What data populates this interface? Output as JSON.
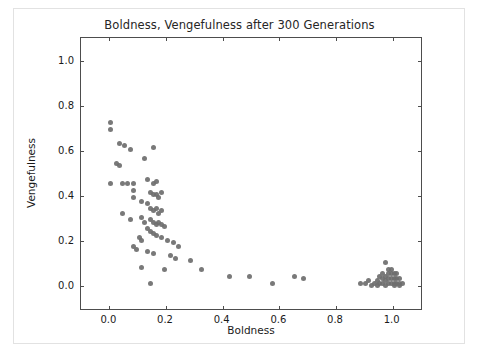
{
  "chart_data": {
    "type": "scatter",
    "title": "Boldness, Vengefulness after 300 Generations",
    "xlabel": "Boldness",
    "ylabel": "Vengefulness",
    "xlim": [
      -0.1,
      1.1
    ],
    "ylim": [
      -0.1,
      1.1
    ],
    "xticks": [
      0.0,
      0.2,
      0.4,
      0.6,
      0.8,
      1.0
    ],
    "xticklabels": [
      "0.0",
      "0.2",
      "0.4",
      "0.6",
      "0.8",
      "1.0"
    ],
    "yticks": [
      0.0,
      0.2,
      0.4,
      0.6,
      0.8,
      1.0
    ],
    "yticklabels": [
      "0.0",
      "0.2",
      "0.4",
      "0.6",
      "0.8",
      "1.0"
    ],
    "grid": false,
    "legend": null,
    "marker_color": "#6e6e6e",
    "marker_size": 5,
    "series": [
      {
        "name": "agents",
        "points": [
          [
            0.005,
            0.725
          ],
          [
            0.005,
            0.695
          ],
          [
            0.035,
            0.635
          ],
          [
            0.055,
            0.625
          ],
          [
            0.075,
            0.605
          ],
          [
            0.025,
            0.545
          ],
          [
            0.035,
            0.535
          ],
          [
            0.125,
            0.565
          ],
          [
            0.155,
            0.615
          ],
          [
            0.005,
            0.455
          ],
          [
            0.045,
            0.455
          ],
          [
            0.065,
            0.455
          ],
          [
            0.085,
            0.455
          ],
          [
            0.085,
            0.425
          ],
          [
            0.085,
            0.395
          ],
          [
            0.135,
            0.475
          ],
          [
            0.155,
            0.455
          ],
          [
            0.165,
            0.465
          ],
          [
            0.145,
            0.415
          ],
          [
            0.155,
            0.405
          ],
          [
            0.165,
            0.405
          ],
          [
            0.175,
            0.395
          ],
          [
            0.185,
            0.415
          ],
          [
            0.115,
            0.375
          ],
          [
            0.135,
            0.365
          ],
          [
            0.145,
            0.345
          ],
          [
            0.155,
            0.335
          ],
          [
            0.165,
            0.345
          ],
          [
            0.175,
            0.325
          ],
          [
            0.185,
            0.335
          ],
          [
            0.045,
            0.325
          ],
          [
            0.075,
            0.295
          ],
          [
            0.115,
            0.305
          ],
          [
            0.125,
            0.285
          ],
          [
            0.145,
            0.295
          ],
          [
            0.155,
            0.285
          ],
          [
            0.165,
            0.275
          ],
          [
            0.175,
            0.285
          ],
          [
            0.185,
            0.275
          ],
          [
            0.195,
            0.265
          ],
          [
            0.135,
            0.255
          ],
          [
            0.145,
            0.245
          ],
          [
            0.155,
            0.235
          ],
          [
            0.165,
            0.225
          ],
          [
            0.105,
            0.215
          ],
          [
            0.115,
            0.205
          ],
          [
            0.185,
            0.215
          ],
          [
            0.205,
            0.205
          ],
          [
            0.225,
            0.195
          ],
          [
            0.245,
            0.175
          ],
          [
            0.085,
            0.175
          ],
          [
            0.095,
            0.165
          ],
          [
            0.135,
            0.155
          ],
          [
            0.155,
            0.145
          ],
          [
            0.215,
            0.135
          ],
          [
            0.235,
            0.125
          ],
          [
            0.285,
            0.115
          ],
          [
            0.115,
            0.085
          ],
          [
            0.145,
            0.015
          ],
          [
            0.195,
            0.075
          ],
          [
            0.325,
            0.075
          ],
          [
            0.425,
            0.045
          ],
          [
            0.495,
            0.045
          ],
          [
            0.575,
            0.015
          ],
          [
            0.655,
            0.045
          ],
          [
            0.685,
            0.035
          ],
          [
            0.885,
            0.015
          ],
          [
            0.905,
            0.015
          ],
          [
            0.915,
            0.025
          ],
          [
            0.935,
            0.015
          ],
          [
            0.945,
            0.025
          ],
          [
            0.955,
            0.015
          ],
          [
            0.955,
            0.045
          ],
          [
            0.965,
            0.055
          ],
          [
            0.965,
            0.035
          ],
          [
            0.965,
            0.015
          ],
          [
            0.975,
            0.025
          ],
          [
            0.975,
            0.045
          ],
          [
            0.975,
            0.105
          ],
          [
            0.985,
            0.015
          ],
          [
            0.985,
            0.035
          ],
          [
            0.985,
            0.055
          ],
          [
            0.985,
            0.075
          ],
          [
            0.995,
            0.015
          ],
          [
            0.995,
            0.035
          ],
          [
            0.995,
            0.055
          ],
          [
            0.995,
            0.075
          ],
          [
            1.005,
            0.015
          ],
          [
            1.005,
            0.035
          ],
          [
            1.005,
            0.055
          ],
          [
            1.015,
            0.015
          ],
          [
            1.015,
            0.035
          ],
          [
            1.015,
            0.055
          ],
          [
            1.025,
            0.015
          ],
          [
            1.025,
            0.035
          ],
          [
            1.035,
            0.015
          ],
          [
            0.925,
            0.005
          ],
          [
            0.945,
            0.005
          ],
          [
            0.975,
            0.005
          ],
          [
            1.005,
            0.005
          ],
          [
            1.025,
            0.005
          ]
        ]
      }
    ]
  }
}
